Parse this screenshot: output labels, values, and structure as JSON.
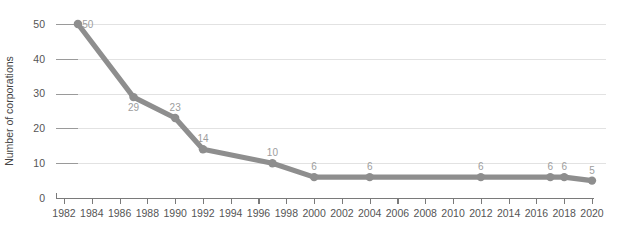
{
  "chart_data": {
    "type": "line",
    "title": "",
    "subtitle": "",
    "xlabel": "",
    "ylabel": "Number of corporations",
    "xlim": [
      1982,
      2020
    ],
    "ylim": [
      0,
      50
    ],
    "grid": true,
    "legend_position": "none",
    "line_color": "#8e8e8e",
    "marker_color": "#8e8e8e",
    "gridline_color": "#e2e2e2",
    "axis_color": "#7a7a7a",
    "label_color": "#9d9d9d",
    "background_color": "#ffffff",
    "x_tick_labels": [
      "1982",
      "1984",
      "1986",
      "1988",
      "1990",
      "1992",
      "1994",
      "1996",
      "1998",
      "2000",
      "2002",
      "2004",
      "2006",
      "2008",
      "2010",
      "2012",
      "2014",
      "2016",
      "2018",
      "2020"
    ],
    "x_ticks": [
      1982,
      1984,
      1986,
      1988,
      1990,
      1992,
      1994,
      1996,
      1998,
      2000,
      2002,
      2004,
      2006,
      2008,
      2010,
      2012,
      2014,
      2016,
      2018,
      2020
    ],
    "y_tick_labels": [
      "0",
      "10",
      "20",
      "30",
      "40",
      "50"
    ],
    "y_ticks": [
      0,
      10,
      20,
      30,
      40,
      50
    ],
    "series": [
      {
        "name": "Number of corporations",
        "x": [
          1983,
          1987,
          1990,
          1992,
          1997,
          2000,
          2004,
          2012,
          2017,
          2018,
          2020
        ],
        "values": [
          50,
          29,
          23,
          14,
          10,
          6,
          6,
          6,
          6,
          6,
          5
        ],
        "point_labels": [
          "50",
          "29",
          "23",
          "14",
          "10",
          "6",
          "6",
          "6",
          "6",
          "6",
          "5"
        ],
        "label_positions": [
          "right",
          "below",
          "above",
          "above",
          "above",
          "above",
          "above",
          "above",
          "above",
          "above",
          "above"
        ]
      }
    ]
  }
}
